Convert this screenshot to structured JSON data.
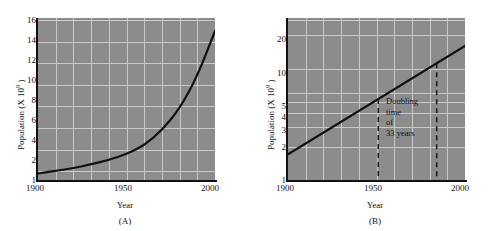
{
  "panels": [
    {
      "id": "A",
      "caption": "(A)",
      "ylabel_text": "Population (X 10",
      "ylabel_sup": "9",
      "ylabel_close": " )",
      "xlabel": "Year",
      "yticks": [
        "16",
        "14",
        "12",
        "10",
        "8",
        "6",
        "4",
        "2",
        "1"
      ],
      "xticks": [
        "1900",
        "1950",
        "2000"
      ]
    },
    {
      "id": "B",
      "caption": "(B)",
      "ylabel_text": "Population (X 10",
      "ylabel_sup": "9",
      "ylabel_close": " )",
      "xlabel": "Year",
      "yticks": [
        "20",
        "10",
        "5",
        "4",
        "3",
        "2",
        "1"
      ],
      "xticks": [
        "1900",
        "1950",
        "2000"
      ],
      "annotation": [
        "Doubling",
        "time",
        "of",
        "33 years"
      ]
    }
  ],
  "colors": {
    "plot_background": "#8c8c8c",
    "gridline": "#c9c9c9",
    "curve": "#111111",
    "axis": "#111111",
    "page_background": "#ffffff"
  },
  "chart_data": [
    {
      "type": "line",
      "title": "(A)",
      "xlabel": "Year",
      "ylabel": "Population (X 10^9)",
      "xlim": [
        1900,
        2000
      ],
      "ylim": [
        1,
        16
      ],
      "yscale": "linear",
      "grid": true,
      "legend": "none",
      "ytick_values": [
        1,
        2,
        4,
        6,
        8,
        10,
        12,
        14,
        16
      ],
      "xtick_values": [
        1900,
        1950,
        2000
      ],
      "x": [
        1900,
        1910,
        1920,
        1930,
        1940,
        1950,
        1960,
        1970,
        1980,
        1990,
        2000
      ],
      "values": [
        1.6,
        1.85,
        2.1,
        2.45,
        2.85,
        3.4,
        4.2,
        5.6,
        7.6,
        10.6,
        14.8
      ],
      "annotations": []
    },
    {
      "type": "line",
      "title": "(B)",
      "xlabel": "Year",
      "ylabel": "Population (X 10^9)",
      "xlim": [
        1900,
        2000
      ],
      "ylim": [
        1,
        30
      ],
      "yscale": "log",
      "grid": true,
      "legend": "none",
      "ytick_values": [
        1,
        2,
        3,
        4,
        5,
        10,
        20
      ],
      "xtick_values": [
        1900,
        1950,
        2000
      ],
      "x": [
        1900,
        2000
      ],
      "values": [
        1.7,
        16.0
      ],
      "annotations": [
        {
          "text": "Doubling time of 33 years",
          "x_start": 1951,
          "x_end": 1984,
          "style": "dashed-vertical-pair"
        }
      ]
    }
  ]
}
